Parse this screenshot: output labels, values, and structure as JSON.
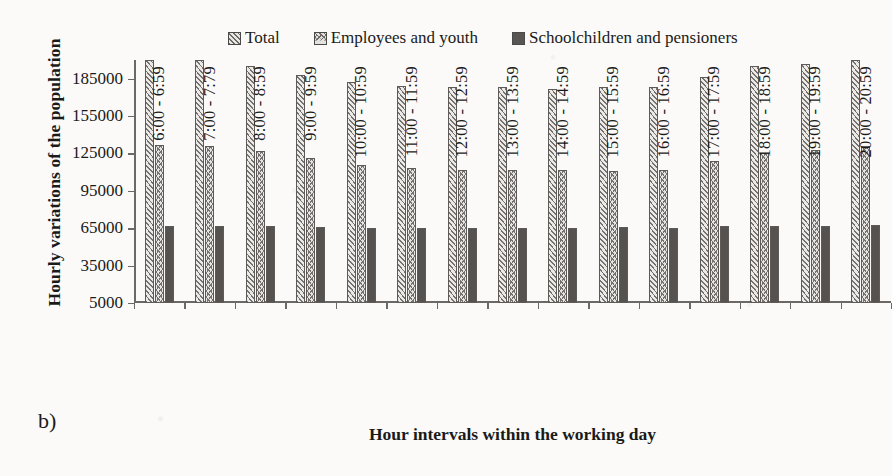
{
  "panel_letter": "b)",
  "axis_titles": {
    "y": "Hourly variations of the population",
    "x": "Hour intervals within the working day"
  },
  "legend": {
    "items": [
      {
        "label": "Total",
        "swatch": "diagonal-hatch-swatch",
        "color": "#6e6a66"
      },
      {
        "label": "Employees and youth",
        "swatch": "chevron-hatch-swatch",
        "color": "#6e6a66"
      },
      {
        "label": "Schoolchildren and pensioners",
        "swatch": "solid-dark-swatch",
        "color": "#595552"
      }
    ]
  },
  "chart_data": {
    "type": "bar",
    "title": "",
    "subtitle": "",
    "xlabel": "Hour intervals within the working day",
    "ylabel": "Hourly variations of the population",
    "ylim": [
      5000,
      200000
    ],
    "yticks": [
      5000,
      35000,
      65000,
      95000,
      125000,
      155000,
      185000
    ],
    "ytick_labels": [
      "5000",
      "35000",
      "65000",
      "95000",
      "125000",
      "155000",
      "185000"
    ],
    "grid": false,
    "legend_position": "top",
    "categories": [
      "6:00 - 6:59",
      "7:00 - 7:79",
      "8:00 - 8:59",
      "9:00 - 9:59",
      "10:00 - 10:59",
      "11:00 - 11:59",
      "12:00 - 12:59",
      "13:00 - 13:59",
      "14:00 - 14:59",
      "15:00 - 15:59",
      "16:00 - 16:59",
      "17:00 - 17:59",
      "18:00 - 18:59",
      "19:00 - 19:59",
      "20:00 - 20:59"
    ],
    "series": [
      {
        "name": "Total",
        "values": [
          200000,
          200000,
          195000,
          188000,
          182000,
          179000,
          178000,
          178000,
          177000,
          178000,
          178000,
          186000,
          195000,
          197000,
          200000
        ]
      },
      {
        "name": "Employees and youth",
        "values": [
          132000,
          131000,
          127000,
          121000,
          116000,
          113000,
          112000,
          112000,
          112000,
          111000,
          112000,
          119000,
          125000,
          128000,
          131000
        ]
      },
      {
        "name": "Schoolchildren and pensioners",
        "values": [
          67000,
          67000,
          66500,
          66000,
          65500,
          65500,
          65500,
          65500,
          65500,
          66000,
          65500,
          66500,
          67000,
          67000,
          68000
        ]
      }
    ]
  }
}
